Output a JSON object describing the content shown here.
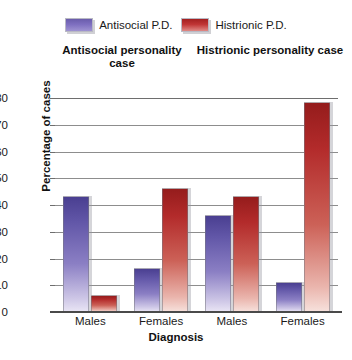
{
  "legend": {
    "entries": [
      {
        "label": "Antisocial P.D.",
        "color": "#6a5cab",
        "key": "antisocial"
      },
      {
        "label": "Histrionic P.D.",
        "color": "#a32020",
        "key": "histrionic"
      }
    ]
  },
  "group_headers": [
    "Antisocial personality case",
    "Histrionic personality case"
  ],
  "axes": {
    "y_title": "Percentage of cases",
    "x_title": "Diagnosis",
    "y_ticks": [
      "0",
      "10",
      "20",
      "30",
      "40",
      "50",
      "60",
      "70",
      "80"
    ],
    "x_ticks": [
      "Males",
      "Females",
      "Males",
      "Females"
    ]
  },
  "chart_data": {
    "type": "bar",
    "title": "",
    "xlabel": "Diagnosis",
    "ylabel": "Percentage of cases",
    "ylim": [
      0,
      80
    ],
    "ytick_step": 10,
    "grid": true,
    "legend_position": "top-center",
    "group_headers": [
      "Antisocial personality case",
      "Histrionic personality case"
    ],
    "categories": [
      "Males",
      "Females",
      "Males",
      "Females"
    ],
    "series": [
      {
        "name": "Antisocial P.D.",
        "color": "#6a5cab",
        "values": [
          43,
          16,
          36,
          11
        ]
      },
      {
        "name": "Histrionic P.D.",
        "color": "#a32020",
        "values": [
          6,
          46,
          43,
          78
        ]
      }
    ]
  }
}
